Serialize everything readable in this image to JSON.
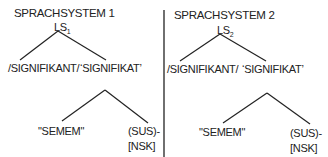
{
  "panels": [
    {
      "title": "SPRACHSYSTEM 1",
      "root": "LS",
      "root_sub": "1",
      "left_leaf": "/SIGNIFIKANT/",
      "right_leaf": "‘SIGNIFIKAT’",
      "sub_left": "\"SEMEM\"",
      "sub_right_top": "(SUS)-",
      "sub_right_bottom": "[NSK]"
    },
    {
      "title": "SPRACHSYSTEM 2",
      "root": "LS",
      "root_sub": "2",
      "left_leaf": "/SIGNIFIKANT/",
      "right_leaf": "‘SIGNIFIKAT’",
      "sub_left": "\"SEMEM\"",
      "sub_right_top": "(SUS)-",
      "sub_right_bottom": "[NSK]"
    }
  ],
  "colors": {
    "ink": "#222222",
    "background": "#ffffff"
  }
}
